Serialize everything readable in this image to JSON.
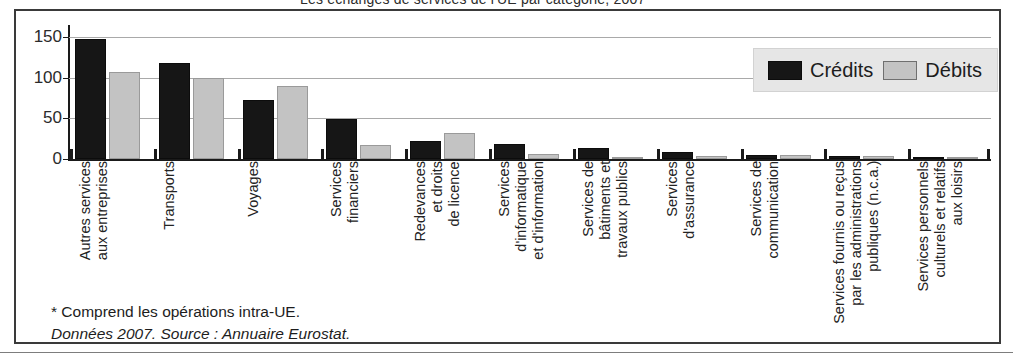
{
  "figure": {
    "title": "Les echanges de services de l'UE par categorie, 2007",
    "notes": {
      "footnote": "* Comprend les opérations intra-UE.",
      "source": "Données 2007. Source : Annuaire Eurostat."
    }
  },
  "legend": {
    "position": "top-right",
    "items": [
      {
        "label": "Crédits",
        "color": "#161616"
      },
      {
        "label": "Débits",
        "color": "#c3c3c3"
      }
    ]
  },
  "chart_data": {
    "type": "bar",
    "title": "",
    "xlabel": "",
    "ylabel": "",
    "ylim": [
      0,
      165
    ],
    "yticks": [
      0,
      50,
      100,
      150
    ],
    "ytick_labels": [
      "0",
      "50",
      "100",
      "150"
    ],
    "grid": true,
    "categories": [
      "Autres services\naux entreprises",
      "Transports",
      "Voyages",
      "Services\nfinanciers",
      "Redevances\net droits\nde licence",
      "Services\nd'informatique\net d'information",
      "Services de\nbâtiments et\ntravaux publics",
      "Services\nd'assurance",
      "Services de\ncommunication",
      "Services fournis ou reçus\npar les administrations\npubliques (n.c.a.)",
      "Services personnels\nculturels et relatifs\naux loisirs"
    ],
    "series": [
      {
        "name": "Crédits",
        "color": "#161616",
        "values": [
          148,
          118,
          73,
          49,
          22,
          19,
          13,
          9,
          5,
          4,
          2
        ]
      },
      {
        "name": "Débits",
        "color": "#c3c3c3",
        "values": [
          107,
          100,
          90,
          17,
          32,
          6,
          3,
          4,
          5,
          4,
          2
        ]
      }
    ]
  }
}
